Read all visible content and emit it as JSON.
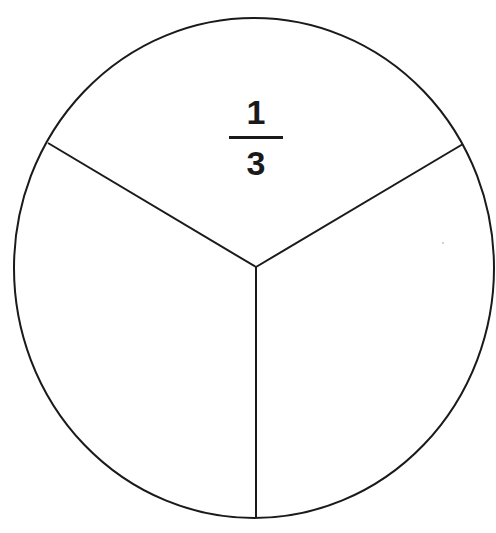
{
  "diagram": {
    "type": "fraction-circle",
    "sectors": 3,
    "labeled_sector": "top",
    "label": {
      "numerator": "1",
      "denominator": "3"
    },
    "colors": {
      "stroke": "#1a1a1a",
      "fill": "#ffffff",
      "text": "#1a1a1a"
    },
    "geometry": {
      "center": [
        256,
        267
      ],
      "ellipse_center": [
        254,
        268
      ],
      "rx": 240,
      "ry": 250,
      "spoke_ends": [
        [
          48,
          143
        ],
        [
          463,
          144
        ],
        [
          256,
          518
        ]
      ]
    }
  }
}
